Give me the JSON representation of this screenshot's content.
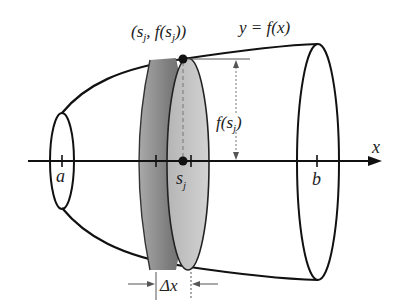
{
  "figure": {
    "type": "solid-of-revolution-disk-method",
    "labels": {
      "point": "(s_j, f(s_j))",
      "point_parts": {
        "open": "(",
        "s": "s",
        "j1": "j",
        "comma": ", f(",
        "s2": "s",
        "j2": "j",
        "close": "))"
      },
      "curve": "y = f(x)",
      "curve_parts": {
        "y": "y",
        "eq": " = ",
        "f": "f",
        "x": "(x)"
      },
      "height": "f(s_j)",
      "height_parts": {
        "f": "f(",
        "s": "s",
        "j": "j",
        "close": ")"
      },
      "axis": "x",
      "a": "a",
      "b": "b",
      "sj": "s",
      "sj_sub": "j",
      "delta": "Δx"
    },
    "colors": {
      "stroke": "#111111",
      "disk_rim": "#6e6e6e",
      "disk_face": "#bdbdbd",
      "dash": "#777777"
    }
  }
}
